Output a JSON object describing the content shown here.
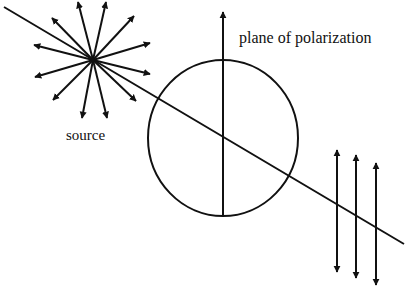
{
  "diagram": {
    "labels": {
      "plane": "plane of polarization",
      "source": "source"
    },
    "colors": {
      "stroke": "#111111",
      "background": "#ffffff"
    },
    "source": {
      "center": [
        93,
        60
      ],
      "ray_tips": [
        [
          78,
          2
        ],
        [
          106,
          2
        ],
        [
          52,
          18
        ],
        [
          134,
          16
        ],
        [
          34,
          45
        ],
        [
          150,
          43
        ],
        [
          35,
          77
        ],
        [
          150,
          74
        ],
        [
          53,
          100
        ],
        [
          136,
          101
        ],
        [
          82,
          118
        ],
        [
          107,
          118
        ]
      ]
    },
    "propagation_line": {
      "from": [
        4,
        7
      ],
      "to": [
        404,
        244
      ]
    },
    "polarizer_circle": {
      "cx": 223,
      "cy": 138,
      "rx": 75,
      "ry": 78
    },
    "polarization_axis": {
      "x": 223,
      "top": 12,
      "bottom": 216
    },
    "polarized_waves": [
      {
        "x": 337,
        "top": 150,
        "bottom": 272
      },
      {
        "x": 356,
        "top": 155,
        "bottom": 278
      },
      {
        "x": 376,
        "top": 163,
        "bottom": 285
      }
    ]
  }
}
